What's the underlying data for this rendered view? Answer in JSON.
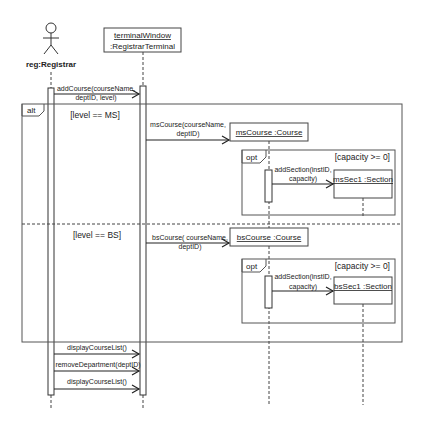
{
  "diagram": {
    "type": "UML sequence diagram",
    "lifelines": [
      {
        "id": "registrar",
        "kind": "actor",
        "label": "reg:Registrar"
      },
      {
        "id": "terminal",
        "kind": "object",
        "name": "terminalWindow",
        "class": ":RegistrarTerminal"
      },
      {
        "id": "msCourse",
        "kind": "object",
        "label": "msCourse :Course"
      },
      {
        "id": "msSec1",
        "kind": "object",
        "label": "msSec1 :Section"
      },
      {
        "id": "bsCourse",
        "kind": "object",
        "label": "bsCourse :Course"
      },
      {
        "id": "bsSec1",
        "kind": "object",
        "label": "bsSec1 :Section"
      }
    ],
    "messages": {
      "addCourse": {
        "line1": "addCourse(courseName,",
        "line2": "deptID, level)"
      },
      "msCourse": {
        "line1": "msCourse(courseName,",
        "line2": "deptID)"
      },
      "msAddSection": {
        "line1": "addSection(instID,",
        "line2": "capacity)"
      },
      "bsCourse": {
        "line1": "bsCourse( courseName,",
        "line2": "deptID)"
      },
      "bsAddSection": {
        "line1": "addSection(instID,",
        "line2": "capacity)"
      },
      "displayCourseList1": "displayCourseList()",
      "removeDepartment": "removeDepartment(deptID)",
      "displayCourseList2": "displayCourseList()"
    },
    "fragments": {
      "alt": {
        "operator": "alt",
        "guard1": "[level == MS]",
        "guard2": "[level == BS]"
      },
      "opt1": {
        "operator": "opt",
        "guard": "[capacity >= 0]"
      },
      "opt2": {
        "operator": "opt",
        "guard": "[capacity >= 0]"
      }
    }
  }
}
